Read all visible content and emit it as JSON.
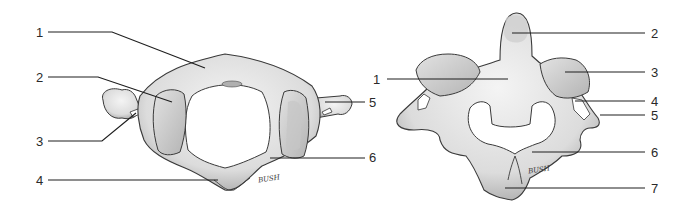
{
  "figure": {
    "left_view": {
      "name": "atlas-superior-view",
      "labels": [
        {
          "num": "1",
          "x": 36,
          "y": 26
        },
        {
          "num": "2",
          "x": 36,
          "y": 71
        },
        {
          "num": "3",
          "x": 36,
          "y": 135
        },
        {
          "num": "4",
          "x": 36,
          "y": 174
        },
        {
          "num": "5",
          "x": 369,
          "y": 96
        },
        {
          "num": "6",
          "x": 369,
          "y": 151
        }
      ],
      "signature": "BUSH"
    },
    "right_view": {
      "name": "axis-posterior-view",
      "labels": [
        {
          "num": "1",
          "x": 373,
          "y": 73
        },
        {
          "num": "2",
          "x": 651,
          "y": 27
        },
        {
          "num": "3",
          "x": 651,
          "y": 66
        },
        {
          "num": "4",
          "x": 651,
          "y": 95
        },
        {
          "num": "5",
          "x": 651,
          "y": 109
        },
        {
          "num": "6",
          "x": 651,
          "y": 146
        },
        {
          "num": "7",
          "x": 651,
          "y": 182
        }
      ],
      "signature": "BUSH"
    },
    "colors": {
      "bone_fill": "#e6e6e6",
      "bone_shade": "#bdbdbd",
      "outline": "#3a3a3a",
      "leader": "#1e1e1e"
    }
  }
}
